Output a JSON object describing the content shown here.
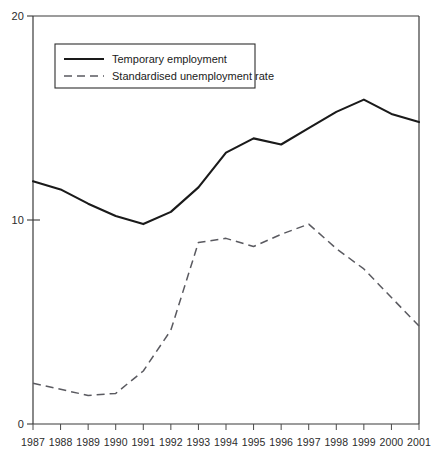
{
  "chart_data": {
    "type": "line",
    "title": "",
    "subtitle": "",
    "xlabel": "",
    "ylabel": "",
    "grid": false,
    "legend_position": "top-left",
    "xlim": [
      1987,
      2001
    ],
    "ylim": [
      0,
      20
    ],
    "y_ticks": [
      0,
      10,
      20
    ],
    "y_tick_labels": [
      "0",
      "10",
      "20"
    ],
    "categories": [
      1987,
      1988,
      1989,
      1990,
      1991,
      1992,
      1993,
      1994,
      1995,
      1996,
      1997,
      1998,
      1999,
      2000,
      2001
    ],
    "x_tick_labels": [
      "1987",
      "1988",
      "1989",
      "1990",
      "1991",
      "1992",
      "1993",
      "1994",
      "1995",
      "1996",
      "1997",
      "1998",
      "1999",
      "2000",
      "2001"
    ],
    "series": [
      {
        "name": "Temporary employment",
        "style": "solid",
        "color": "#1a1a1a",
        "values": [
          11.9,
          11.5,
          10.8,
          10.2,
          9.8,
          10.4,
          11.6,
          13.3,
          14.0,
          13.7,
          14.5,
          15.3,
          15.9,
          15.2,
          14.8
        ]
      },
      {
        "name": "Standardised unemployment rate",
        "style": "dashed",
        "color": "#5a5a60",
        "values": [
          2.0,
          1.7,
          1.4,
          1.5,
          2.6,
          4.6,
          8.9,
          9.1,
          8.7,
          9.3,
          9.8,
          8.6,
          7.6,
          6.2,
          4.8
        ]
      }
    ]
  },
  "legend": {
    "entries": [
      {
        "label": "Temporary employment",
        "style": "solid"
      },
      {
        "label": "Standardised unemployment rate",
        "style": "dashed"
      }
    ]
  },
  "axis": {
    "y_top_label": "20",
    "y_mid_label": "10",
    "y_bottom_label": "0"
  }
}
